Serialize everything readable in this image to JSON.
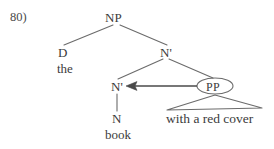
{
  "figure": {
    "example_number": "80)",
    "type": "syntax-tree",
    "line_color": "#6b6b6b",
    "text_color": "#3b3b3b",
    "background_color": "#ffffff"
  },
  "nodes": {
    "np": {
      "label": "NP",
      "x": 116,
      "y": 17
    },
    "d": {
      "label": "D",
      "x": 63,
      "y": 52
    },
    "nbar_top": {
      "label": "N'",
      "x": 166,
      "y": 52
    },
    "nbar_inner": {
      "label": "N'",
      "x": 117,
      "y": 86
    },
    "n": {
      "label": "N",
      "x": 117,
      "y": 118
    },
    "pp": {
      "label": "PP",
      "x": 215,
      "y": 86
    }
  },
  "terminals": {
    "the": {
      "label": "the",
      "x": 65,
      "y": 68
    },
    "book": {
      "label": "book",
      "x": 118,
      "y": 134
    },
    "pp_phrase": {
      "label": "with a red cover",
      "x": 213,
      "y": 118
    }
  },
  "annotations": {
    "movement_arrow": {
      "name": "pp-to-nbar-arrow",
      "from_x": 197,
      "to_x": 127,
      "y": 86,
      "direction": "left"
    },
    "pp_ellipse": {
      "cx": 215,
      "cy": 86,
      "rx": 18,
      "ry": 8
    },
    "pp_triangle": {
      "apex_x": 215,
      "apex_y": 95,
      "left_x": 167,
      "left_y": 110,
      "right_x": 262,
      "right_y": 108
    }
  },
  "branches": [
    {
      "name": "np-to-d",
      "x1": 113,
      "y1": 25,
      "x2": 64,
      "y2": 45
    },
    {
      "name": "np-to-nbar",
      "x1": 120,
      "y1": 25,
      "x2": 167,
      "y2": 45
    },
    {
      "name": "nbar-to-nbar",
      "x1": 163,
      "y1": 59,
      "x2": 118,
      "y2": 79
    },
    {
      "name": "nbar-to-pp",
      "x1": 169,
      "y1": 59,
      "x2": 213,
      "y2": 78
    },
    {
      "name": "nbar-to-n",
      "x1": 117,
      "y1": 93,
      "x2": 117,
      "y2": 111
    }
  ]
}
